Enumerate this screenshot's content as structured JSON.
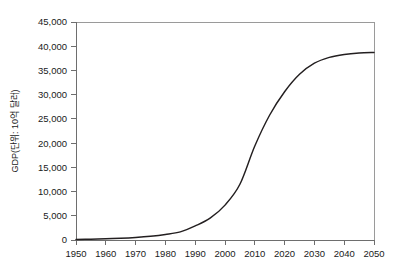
{
  "chart_data": {
    "type": "line",
    "title": "",
    "xlabel": "",
    "ylabel": "GDP(단위: 10억 달러)",
    "xlim": [
      1950,
      2050
    ],
    "ylim": [
      0,
      45000
    ],
    "grid": false,
    "legend": "none",
    "x_ticks": [
      "1950",
      "1960",
      "1970",
      "1980",
      "1990",
      "2000",
      "2010",
      "2020",
      "2030",
      "2040",
      "2050"
    ],
    "y_ticks": [
      "0",
      "5,000",
      "10,000",
      "15,000",
      "20,000",
      "25,000",
      "30,000",
      "35,000",
      "40,000",
      "45,000"
    ],
    "series": [
      {
        "name": "GDP",
        "color": "#231f20",
        "x": [
          1950,
          1955,
          1960,
          1965,
          1970,
          1975,
          1980,
          1985,
          1990,
          1995,
          2000,
          2005,
          2010,
          2015,
          2020,
          2025,
          2030,
          2035,
          2040,
          2045,
          2050
        ],
        "values": [
          120,
          170,
          250,
          360,
          530,
          780,
          1150,
          1680,
          2900,
          4500,
          7200,
          11500,
          19400,
          25800,
          30600,
          34200,
          36500,
          37700,
          38300,
          38600,
          38700
        ]
      }
    ]
  },
  "axes": {
    "y_axis_label": "GDP(단위: 10억 달러)"
  }
}
